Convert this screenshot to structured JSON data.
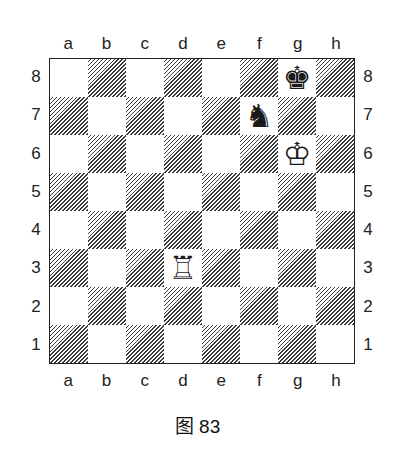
{
  "diagram": {
    "caption": "图 83",
    "files": [
      "a",
      "b",
      "c",
      "d",
      "e",
      "f",
      "g",
      "h"
    ],
    "ranks": [
      "8",
      "7",
      "6",
      "5",
      "4",
      "3",
      "2",
      "1"
    ],
    "pieces": [
      {
        "square": "g8",
        "color": "black",
        "type": "king",
        "glyph": "♚"
      },
      {
        "square": "f7",
        "color": "black",
        "type": "knight",
        "glyph": "♞"
      },
      {
        "square": "g6",
        "color": "white",
        "type": "king",
        "glyph": "♔"
      },
      {
        "square": "d3",
        "color": "white",
        "type": "rook",
        "glyph": "♖"
      }
    ],
    "colors": {
      "border": "#222222",
      "hatch": "#3a3a3a",
      "light": "#ffffff"
    }
  }
}
